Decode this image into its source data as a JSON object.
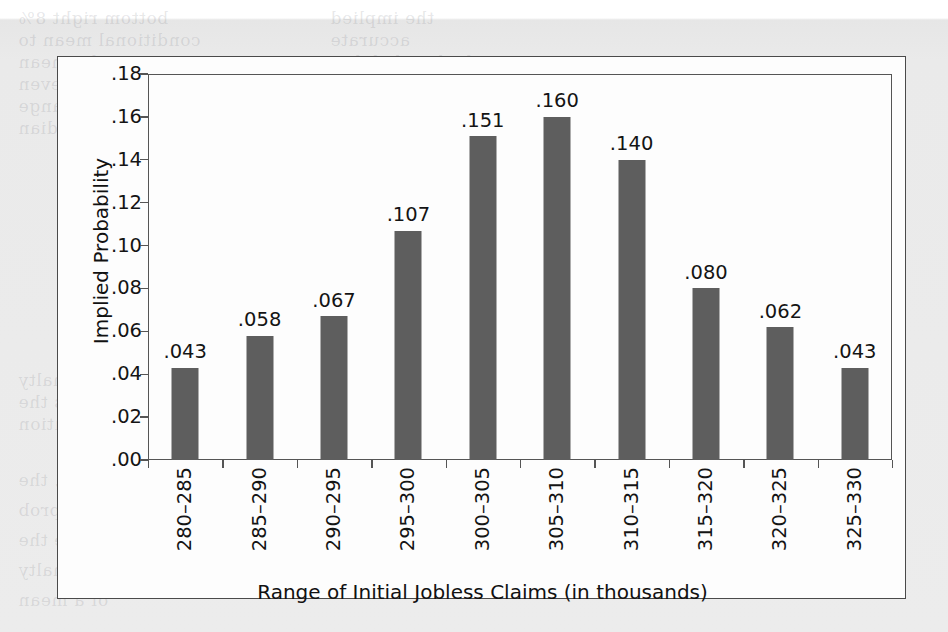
{
  "chart_data": {
    "type": "bar",
    "title": "",
    "xlabel": "Range of Initial Jobless Claims (in thousands)",
    "ylabel": "Implied Probability",
    "categories": [
      "280–285",
      "285–290",
      "290–295",
      "295–300",
      "300–305",
      "305–310",
      "310–315",
      "315–320",
      "320–325",
      "325–330"
    ],
    "values": [
      0.043,
      0.058,
      0.067,
      0.107,
      0.151,
      0.16,
      0.14,
      0.08,
      0.062,
      0.043
    ],
    "value_labels": [
      ".043",
      ".058",
      ".067",
      ".107",
      ".151",
      ".160",
      ".140",
      ".080",
      ".062",
      ".043"
    ],
    "ylim": [
      0,
      0.18
    ],
    "ytick_values": [
      0.18,
      0.16,
      0.14,
      0.12,
      0.1,
      0.08,
      0.06,
      0.04,
      0.02,
      0.0
    ],
    "ytick_labels": [
      ".18",
      ".16",
      ".14",
      ".12",
      ".10",
      ".08",
      ".06",
      ".04",
      ".02",
      ".00"
    ],
    "grid": false,
    "legend": "none",
    "bar_color": "#5e5e5e",
    "axis_color": "#555555",
    "text_color": "#141414"
  },
  "figure": {
    "background_color": "#fdfdfd",
    "page_color": "#ebebeb",
    "border_color": "#4a4a4a"
  },
  "ghost_text": {
    "lines": [
      "bottom right 8%",
      "conditional mean to",
      "in the mean",
      "and even",
      "the range",
      "the median",
      "the penalty",
      "as the",
      "and implied distribution",
      "however, the",
      "in a prob",
      "Implied Average the",
      "the penalty",
      "of a mean",
      "the implied",
      "accurate",
      "Implied probability",
      "is presented",
      "moved toward",
      "of the range"
    ]
  }
}
